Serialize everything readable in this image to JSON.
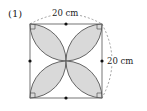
{
  "figure": {
    "problem_number": "(1)",
    "top_dimension": "20 cm",
    "right_dimension": "20 cm",
    "shape": "square with four lens-shaped petals from each corner to center",
    "colors": {
      "stroke": "#555555",
      "petal_fill": "#d9d9d9",
      "dashed": "#888888",
      "dot": "#111111"
    }
  }
}
